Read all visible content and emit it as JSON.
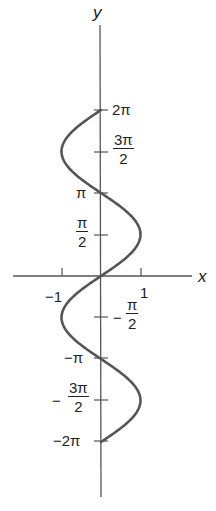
{
  "chart_data": {
    "type": "line",
    "title": "",
    "equation": "x = sin y",
    "xlabel": "x",
    "ylabel": "y",
    "xlim": [
      -1.5,
      1.5
    ],
    "ylim": [
      -2.3,
      2.3
    ],
    "x_ticks": [
      {
        "value": -1,
        "label": "-1"
      },
      {
        "value": 1,
        "label": "1"
      }
    ],
    "y_ticks": [
      {
        "value": "2π",
        "label": "2π"
      },
      {
        "value": "3π/2",
        "label": "3π/2"
      },
      {
        "value": "π",
        "label": "π"
      },
      {
        "value": "π/2",
        "label": "π/2"
      },
      {
        "value": "-π/2",
        "label": "-π/2"
      },
      {
        "value": "-π",
        "label": "-π"
      },
      {
        "value": "-3π/2",
        "label": "-3π/2"
      },
      {
        "value": "-2π",
        "label": "-2π"
      }
    ],
    "series": [
      {
        "name": "x = sin y",
        "y_units_of_pi": [
          -2,
          -1.5,
          -1,
          -0.5,
          0,
          0.5,
          1,
          1.5,
          2
        ],
        "x": [
          0,
          1,
          0,
          -1,
          0,
          1,
          0,
          -1,
          0
        ]
      }
    ],
    "grid": false,
    "legend": "none",
    "curve_color": "#555555",
    "axis_color": "#555555"
  },
  "labels": {
    "x_axis": "x",
    "y_axis": "y",
    "x_neg1": "−1",
    "x_pos1": "1",
    "two_pi": "2π",
    "three_pi_num": "3π",
    "three_pi_den": "2",
    "pi": "π",
    "pi_half_num": "π",
    "pi_half_den": "2",
    "neg_pi_half_sign": "−",
    "neg_pi_half_num": "π",
    "neg_pi_half_den": "2",
    "neg_pi": "−π",
    "neg_three_pi_sign": "−",
    "neg_three_pi_num": "3π",
    "neg_three_pi_den": "2",
    "neg_two_pi": "−2π"
  }
}
